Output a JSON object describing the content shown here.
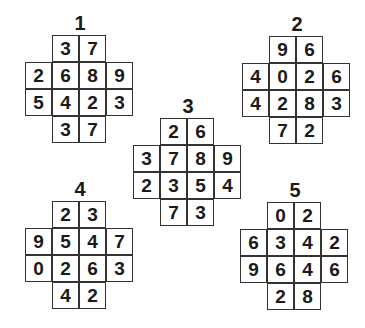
{
  "puzzles": [
    {
      "label": "1",
      "x": 25,
      "y": 13,
      "rows": [
        [
          "3",
          "7"
        ],
        [
          "2",
          "6",
          "8",
          "9"
        ],
        [
          "5",
          "4",
          "2",
          "3"
        ],
        [
          "3",
          "7"
        ]
      ]
    },
    {
      "label": "2",
      "x": 242,
      "y": 14,
      "rows": [
        [
          "9",
          "6"
        ],
        [
          "4",
          "0",
          "2",
          "6"
        ],
        [
          "4",
          "2",
          "8",
          "3"
        ],
        [
          "7",
          "2"
        ]
      ]
    },
    {
      "label": "3",
      "x": 133,
      "y": 96,
      "rows": [
        [
          "2",
          "6"
        ],
        [
          "3",
          "7",
          "8",
          "9"
        ],
        [
          "2",
          "3",
          "5",
          "4"
        ],
        [
          "7",
          "3"
        ]
      ]
    },
    {
      "label": "4",
      "x": 25,
      "y": 179,
      "rows": [
        [
          "2",
          "3"
        ],
        [
          "9",
          "5",
          "4",
          "7"
        ],
        [
          "0",
          "2",
          "6",
          "3"
        ],
        [
          "4",
          "2"
        ]
      ]
    },
    {
      "label": "5",
      "x": 240,
      "y": 180,
      "rows": [
        [
          "0",
          "2"
        ],
        [
          "6",
          "3",
          "4",
          "2"
        ],
        [
          "9",
          "6",
          "4",
          "6"
        ],
        [
          "2",
          "8"
        ]
      ]
    }
  ]
}
